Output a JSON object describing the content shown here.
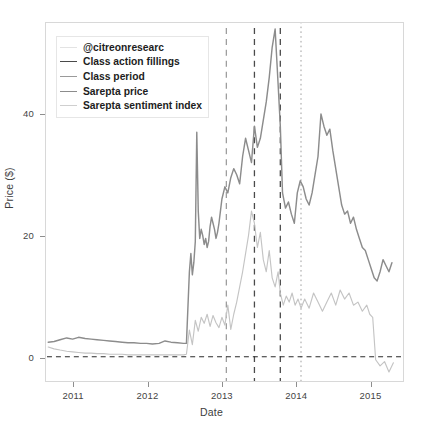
{
  "chart_data": {
    "type": "line",
    "title": "",
    "xlabel": "Date",
    "ylabel": "Price ($)",
    "xlim": [
      2010.62,
      2015.45
    ],
    "ylim": [
      -4.0,
      55.0
    ],
    "grid": false,
    "legend_position": "upper-left",
    "yticks": [
      0,
      20,
      40
    ],
    "ytick_labels": [
      "0",
      "20",
      "40"
    ],
    "xticks": [
      2011,
      2012,
      2013,
      2014,
      2015
    ],
    "xtick_labels": [
      "2011",
      "2012",
      "2013",
      "2014",
      "2015"
    ],
    "zero_line": {
      "y": 0,
      "style": "dashed",
      "color": "#2b2b2b"
    },
    "vlines": [
      {
        "name": "class-period-start",
        "x": 2013.06,
        "label": "Class period",
        "color": "#9e9e9e",
        "style": "dashed"
      },
      {
        "name": "class-action-filing-1",
        "x": 2013.44,
        "label": "Class action fillings",
        "color": "#4a4a4a",
        "style": "dashed"
      },
      {
        "name": "class-action-filing-2",
        "x": 2013.79,
        "label": "Class action fillings",
        "color": "#4a4a4a",
        "style": "dashed"
      },
      {
        "name": "class-period-end",
        "x": 2014.07,
        "label": "Class period",
        "color": "#9e9e9e",
        "style": "dotted"
      }
    ],
    "series": [
      {
        "name": "Sarepta price",
        "color": "#8c8c8c",
        "x": [
          2010.65,
          2010.73,
          2010.81,
          2010.9,
          2010.98,
          2011.06,
          2011.15,
          2011.23,
          2011.31,
          2011.4,
          2011.48,
          2011.56,
          2011.65,
          2011.73,
          2011.81,
          2011.9,
          2011.98,
          2012.06,
          2012.15,
          2012.23,
          2012.31,
          2012.4,
          2012.48,
          2012.52,
          2012.56,
          2012.58,
          2012.6,
          2012.62,
          2012.64,
          2012.66,
          2012.68,
          2012.7,
          2012.72,
          2012.74,
          2012.76,
          2012.78,
          2012.8,
          2012.82,
          2012.84,
          2012.86,
          2012.88,
          2012.9,
          2012.92,
          2012.94,
          2012.96,
          2012.98,
          2013.0,
          2013.04,
          2013.08,
          2013.12,
          2013.16,
          2013.2,
          2013.24,
          2013.28,
          2013.32,
          2013.36,
          2013.4,
          2013.44,
          2013.48,
          2013.52,
          2013.56,
          2013.6,
          2013.64,
          2013.68,
          2013.72,
          2013.76,
          2013.79,
          2013.82,
          2013.86,
          2013.9,
          2013.94,
          2013.98,
          2014.02,
          2014.06,
          2014.1,
          2014.14,
          2014.18,
          2014.22,
          2014.26,
          2014.3,
          2014.34,
          2014.38,
          2014.42,
          2014.46,
          2014.5,
          2014.54,
          2014.58,
          2014.62,
          2014.66,
          2014.7,
          2014.74,
          2014.78,
          2014.82,
          2014.86,
          2014.9,
          2014.94,
          2014.98,
          2015.02,
          2015.06,
          2015.1,
          2015.14,
          2015.18,
          2015.22,
          2015.26,
          2015.3
        ],
        "y": [
          2.4,
          2.5,
          2.8,
          3.1,
          2.9,
          3.2,
          3.0,
          2.9,
          2.8,
          2.7,
          2.6,
          2.5,
          2.4,
          2.3,
          2.3,
          2.2,
          2.2,
          2.1,
          2.2,
          2.6,
          2.4,
          2.3,
          2.2,
          2.2,
          14.0,
          17.0,
          13.5,
          15.5,
          19.0,
          37.0,
          24.0,
          19.5,
          21.0,
          20.0,
          18.5,
          19.5,
          18.0,
          19.0,
          21.5,
          23.0,
          22.0,
          21.0,
          19.5,
          20.5,
          22.0,
          24.0,
          26.0,
          28.0,
          27.0,
          29.5,
          31.0,
          30.0,
          28.5,
          33.0,
          36.0,
          34.0,
          32.0,
          38.0,
          34.5,
          36.0,
          39.0,
          42.0,
          46.0,
          51.0,
          54.0,
          45.0,
          38.0,
          27.0,
          24.5,
          25.5,
          23.5,
          22.0,
          27.0,
          29.0,
          28.0,
          26.0,
          25.0,
          27.0,
          30.0,
          33.0,
          40.0,
          38.0,
          36.5,
          37.5,
          34.0,
          31.0,
          28.0,
          25.0,
          23.5,
          24.0,
          22.0,
          23.0,
          21.0,
          19.5,
          18.0,
          17.5,
          16.0,
          14.5,
          13.0,
          12.5,
          14.0,
          16.0,
          15.0,
          14.0,
          15.5
        ]
      },
      {
        "name": "Sarepta sentiment index",
        "color": "#c4c4c4",
        "x": [
          2010.65,
          2010.73,
          2010.81,
          2010.9,
          2010.98,
          2011.06,
          2011.15,
          2011.23,
          2011.31,
          2011.4,
          2011.48,
          2011.56,
          2011.65,
          2011.73,
          2011.81,
          2011.9,
          2011.98,
          2012.06,
          2012.15,
          2012.23,
          2012.31,
          2012.4,
          2012.48,
          2012.52,
          2012.56,
          2012.6,
          2012.64,
          2012.68,
          2012.72,
          2012.76,
          2012.8,
          2012.84,
          2012.88,
          2012.92,
          2012.96,
          2013.0,
          2013.04,
          2013.08,
          2013.12,
          2013.16,
          2013.2,
          2013.24,
          2013.28,
          2013.32,
          2013.36,
          2013.4,
          2013.44,
          2013.48,
          2013.52,
          2013.56,
          2013.6,
          2013.64,
          2013.68,
          2013.72,
          2013.76,
          2013.79,
          2013.83,
          2013.87,
          2013.91,
          2013.95,
          2013.99,
          2014.03,
          2014.07,
          2014.12,
          2014.18,
          2014.24,
          2014.3,
          2014.36,
          2014.42,
          2014.48,
          2014.54,
          2014.6,
          2014.66,
          2014.72,
          2014.78,
          2014.84,
          2014.9,
          2014.96,
          2015.0,
          2015.04,
          2015.08,
          2015.14,
          2015.2,
          2015.26,
          2015.32
        ],
        "y": [
          1.6,
          1.3,
          1.1,
          0.9,
          0.8,
          0.7,
          0.6,
          0.6,
          0.5,
          0.5,
          0.4,
          0.4,
          0.4,
          0.3,
          0.3,
          0.3,
          0.3,
          0.3,
          0.3,
          0.3,
          0.3,
          0.3,
          0.3,
          0.4,
          4.4,
          2.0,
          6.0,
          4.2,
          6.5,
          5.5,
          7.0,
          5.0,
          6.8,
          5.6,
          4.8,
          6.5,
          5.2,
          8.5,
          4.5,
          7.0,
          9.0,
          11.5,
          14.0,
          17.0,
          20.0,
          24.0,
          22.0,
          18.0,
          20.5,
          16.0,
          14.0,
          17.5,
          13.0,
          11.5,
          14.0,
          10.5,
          8.5,
          10.0,
          9.0,
          10.5,
          8.5,
          9.5,
          8.0,
          9.5,
          8.0,
          10.5,
          9.0,
          7.5,
          9.0,
          10.5,
          8.5,
          11.0,
          9.5,
          10.5,
          8.5,
          9.0,
          7.5,
          8.5,
          7.0,
          6.5,
          -0.5,
          -1.5,
          -0.8,
          -2.5,
          -1.0
        ]
      }
    ],
    "legend": [
      {
        "label": "@citreonresearc",
        "color": "#e3e3e3",
        "style": "solid"
      },
      {
        "label": "Class action fillings",
        "color": "#4a4a4a",
        "style": "solid"
      },
      {
        "label": "Class period",
        "color": "#9a9a9a",
        "style": "solid"
      },
      {
        "label": "Sarepta price",
        "color": "#8c8c8c",
        "style": "solid"
      },
      {
        "label": "Sarepta sentiment index",
        "color": "#cfcfcf",
        "style": "solid"
      }
    ]
  }
}
